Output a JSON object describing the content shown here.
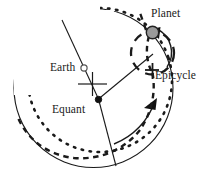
{
  "diagram": {
    "background_color": "#ffffff",
    "stroke_color": "#1a1a1a",
    "planet_fill_color": "#9a9a9a",
    "labels": {
      "planet": "Planet",
      "epicycle": "Epicycle",
      "earth": "Earth",
      "equant": "Equant"
    },
    "markers": {
      "earth_marker": "small-open-circle",
      "equant_marker": "filled-dot",
      "planet_marker": "gray-filled-circle",
      "epicycle_center_marker": "cross-tick",
      "center_marker": "cross-hair"
    },
    "elements": {
      "deferent_circle": "solid-large-circle",
      "planet_path": "thick-dotted-arc",
      "epicycle_circle": "dashed-circle",
      "motion_arrow_deferent": "solid-arc-arrow",
      "motion_arrow_epicycle": "solid-arc-arrow",
      "radius_line_upper": "solid-line",
      "radius_line_lower": "solid-line",
      "equant_to_epicycle_line": "solid-line"
    }
  }
}
